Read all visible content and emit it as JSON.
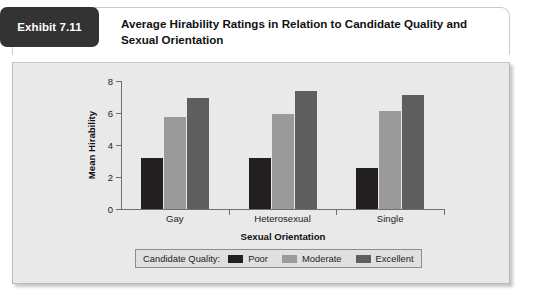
{
  "exhibit": {
    "badge_label": "Exhibit 7.11",
    "title": "Average Hirability Ratings in Relation to Candidate Quality and Sexual Orientation",
    "badge_color": "#333333",
    "panel_color": "#e9e9e9"
  },
  "legend": {
    "title": "Candidate Quality:"
  },
  "chart_data": {
    "type": "bar",
    "title": "Average Hirability Ratings in Relation to Candidate Quality and Sexual Orientation",
    "xlabel": "Sexual Orientation",
    "ylabel": "Mean Hirability",
    "categories": [
      "Gay",
      "Heterosexual",
      "Single"
    ],
    "yticks": [
      0,
      2,
      4,
      6,
      8
    ],
    "ylim": [
      0,
      8
    ],
    "grid": false,
    "legend_position": "bottom",
    "series": [
      {
        "name": "Poor",
        "color": "#231f20",
        "values": [
          3.2,
          3.2,
          2.55
        ]
      },
      {
        "name": "Moderate",
        "color": "#9a9a9a",
        "values": [
          5.75,
          5.95,
          6.1
        ]
      },
      {
        "name": "Excellent",
        "color": "#5e5e5e",
        "values": [
          6.95,
          7.35,
          7.15
        ]
      }
    ]
  }
}
